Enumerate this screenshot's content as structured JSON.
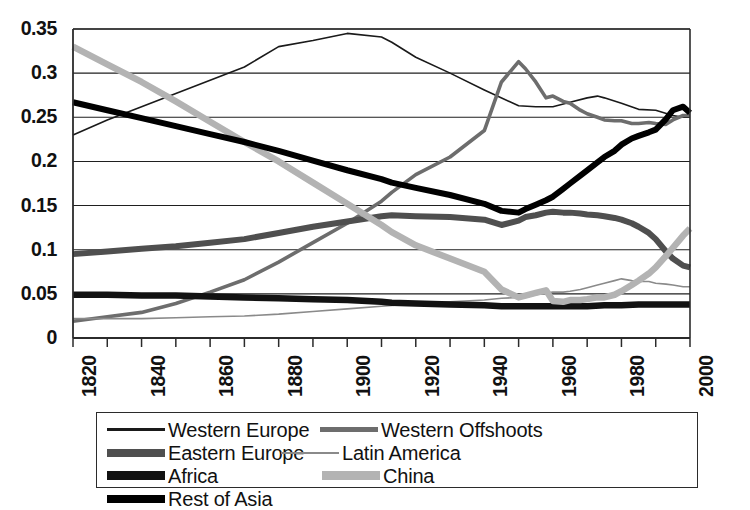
{
  "chart_data": {
    "type": "line",
    "title": "",
    "xlabel": "",
    "ylabel": "",
    "xlim": [
      1820,
      2000
    ],
    "ylim": [
      0,
      0.35
    ],
    "grid": true,
    "grid_axis": "y",
    "legend_position": "bottom",
    "x_tick_labels": [
      "1820",
      "1840",
      "1860",
      "1880",
      "1900",
      "1920",
      "1940",
      "1960",
      "1980",
      "2000"
    ],
    "x_tick_values": [
      1820,
      1840,
      1860,
      1880,
      1900,
      1920,
      1940,
      1960,
      1980,
      2000
    ],
    "x_minor_tick_interval": 10,
    "y_tick_labels": [
      "0",
      "0.05",
      "0.1",
      "0.15",
      "0.2",
      "0.25",
      "0.3",
      "0.35"
    ],
    "y_tick_values": [
      0,
      0.05,
      0.1,
      0.15,
      0.2,
      0.25,
      0.3,
      0.35
    ],
    "series": [
      {
        "name": "Western Europe",
        "color": "#1a1a1a",
        "width": 1.6,
        "x": [
          1820,
          1830,
          1840,
          1850,
          1860,
          1870,
          1880,
          1890,
          1900,
          1910,
          1913,
          1920,
          1930,
          1940,
          1950,
          1955,
          1960,
          1965,
          1970,
          1973,
          1975,
          1980,
          1985,
          1990,
          1995,
          1998,
          2000
        ],
        "values": [
          0.23,
          0.247,
          0.262,
          0.277,
          0.292,
          0.307,
          0.33,
          0.337,
          0.345,
          0.341,
          0.335,
          0.318,
          0.3,
          0.281,
          0.263,
          0.262,
          0.262,
          0.267,
          0.272,
          0.274,
          0.272,
          0.266,
          0.259,
          0.258,
          0.252,
          0.25,
          0.25
        ]
      },
      {
        "name": "Western Offshoots",
        "color": "#6d6d6d",
        "width": 3.6,
        "x": [
          1820,
          1830,
          1840,
          1850,
          1860,
          1870,
          1880,
          1890,
          1900,
          1910,
          1913,
          1920,
          1930,
          1940,
          1945,
          1950,
          1952,
          1955,
          1958,
          1960,
          1963,
          1965,
          1968,
          1970,
          1973,
          1975,
          1978,
          1980,
          1983,
          1985,
          1988,
          1990,
          1993,
          1995,
          1998,
          2000
        ],
        "values": [
          0.019,
          0.024,
          0.029,
          0.039,
          0.052,
          0.066,
          0.086,
          0.108,
          0.13,
          0.155,
          0.165,
          0.185,
          0.205,
          0.235,
          0.29,
          0.313,
          0.305,
          0.29,
          0.272,
          0.274,
          0.268,
          0.266,
          0.258,
          0.254,
          0.25,
          0.247,
          0.246,
          0.246,
          0.243,
          0.243,
          0.244,
          0.243,
          0.242,
          0.247,
          0.252,
          0.252
        ]
      },
      {
        "name": "Eastern Europe",
        "color": "#4f4f4f",
        "width": 6.0,
        "x": [
          1820,
          1830,
          1840,
          1850,
          1860,
          1870,
          1880,
          1890,
          1900,
          1910,
          1913,
          1920,
          1930,
          1940,
          1945,
          1950,
          1952,
          1955,
          1958,
          1960,
          1963,
          1965,
          1968,
          1970,
          1973,
          1975,
          1978,
          1980,
          1983,
          1985,
          1988,
          1990,
          1993,
          1995,
          1998,
          2000
        ],
        "values": [
          0.095,
          0.098,
          0.101,
          0.104,
          0.108,
          0.112,
          0.119,
          0.126,
          0.132,
          0.138,
          0.139,
          0.138,
          0.137,
          0.134,
          0.128,
          0.133,
          0.137,
          0.139,
          0.142,
          0.143,
          0.142,
          0.142,
          0.141,
          0.14,
          0.139,
          0.138,
          0.136,
          0.134,
          0.13,
          0.126,
          0.119,
          0.112,
          0.098,
          0.09,
          0.082,
          0.08
        ]
      },
      {
        "name": "Latin America",
        "color": "#8a8a8a",
        "width": 1.6,
        "x": [
          1820,
          1830,
          1840,
          1850,
          1860,
          1870,
          1880,
          1890,
          1900,
          1910,
          1913,
          1920,
          1930,
          1940,
          1945,
          1950,
          1952,
          1955,
          1958,
          1960,
          1963,
          1965,
          1968,
          1970,
          1973,
          1975,
          1978,
          1980,
          1983,
          1985,
          1988,
          1990,
          1993,
          1995,
          1998,
          2000
        ],
        "values": [
          0.022,
          0.022,
          0.022,
          0.023,
          0.024,
          0.025,
          0.027,
          0.03,
          0.033,
          0.036,
          0.037,
          0.039,
          0.041,
          0.043,
          0.045,
          0.046,
          0.046,
          0.049,
          0.051,
          0.052,
          0.052,
          0.053,
          0.055,
          0.057,
          0.06,
          0.062,
          0.065,
          0.067,
          0.065,
          0.064,
          0.064,
          0.062,
          0.061,
          0.06,
          0.058,
          0.058
        ]
      },
      {
        "name": "Africa",
        "color": "#121212",
        "width": 6.5,
        "x": [
          1820,
          1830,
          1840,
          1850,
          1860,
          1870,
          1880,
          1890,
          1900,
          1910,
          1913,
          1920,
          1930,
          1940,
          1945,
          1950,
          1955,
          1960,
          1965,
          1970,
          1975,
          1980,
          1985,
          1990,
          1995,
          1998,
          2000
        ],
        "values": [
          0.049,
          0.049,
          0.048,
          0.048,
          0.047,
          0.046,
          0.045,
          0.044,
          0.043,
          0.041,
          0.04,
          0.039,
          0.038,
          0.037,
          0.036,
          0.036,
          0.036,
          0.036,
          0.036,
          0.036,
          0.037,
          0.037,
          0.038,
          0.038,
          0.038,
          0.038,
          0.038
        ]
      },
      {
        "name": "China",
        "color": "#b3b3b3",
        "width": 6.5,
        "x": [
          1820,
          1830,
          1840,
          1850,
          1860,
          1870,
          1880,
          1890,
          1900,
          1910,
          1913,
          1920,
          1930,
          1940,
          1945,
          1950,
          1952,
          1955,
          1958,
          1960,
          1963,
          1965,
          1968,
          1970,
          1973,
          1975,
          1978,
          1980,
          1983,
          1985,
          1988,
          1990,
          1993,
          1995,
          1998,
          2000
        ],
        "values": [
          0.33,
          0.31,
          0.29,
          0.268,
          0.245,
          0.222,
          0.2,
          0.176,
          0.152,
          0.128,
          0.12,
          0.105,
          0.09,
          0.075,
          0.055,
          0.046,
          0.048,
          0.051,
          0.054,
          0.042,
          0.041,
          0.043,
          0.043,
          0.044,
          0.046,
          0.046,
          0.049,
          0.053,
          0.06,
          0.065,
          0.073,
          0.08,
          0.093,
          0.102,
          0.116,
          0.124
        ]
      },
      {
        "name": "Rest of Asia",
        "color": "#000000",
        "width": 6.0,
        "x": [
          1820,
          1830,
          1840,
          1850,
          1860,
          1870,
          1880,
          1890,
          1900,
          1910,
          1913,
          1920,
          1930,
          1940,
          1945,
          1950,
          1952,
          1955,
          1958,
          1960,
          1963,
          1965,
          1968,
          1970,
          1973,
          1975,
          1978,
          1980,
          1983,
          1985,
          1988,
          1990,
          1993,
          1995,
          1998,
          2000
        ],
        "values": [
          0.267,
          0.258,
          0.249,
          0.24,
          0.231,
          0.222,
          0.212,
          0.201,
          0.19,
          0.18,
          0.176,
          0.17,
          0.162,
          0.152,
          0.144,
          0.142,
          0.146,
          0.151,
          0.156,
          0.16,
          0.169,
          0.175,
          0.184,
          0.19,
          0.199,
          0.205,
          0.212,
          0.219,
          0.226,
          0.229,
          0.233,
          0.236,
          0.248,
          0.258,
          0.262,
          0.255
        ]
      }
    ]
  },
  "legend": {
    "items": [
      {
        "label": "Western Europe",
        "color": "#1a1a1a",
        "thickness": 3
      },
      {
        "label": "Western Offshoots",
        "color": "#6d6d6d",
        "thickness": 5
      },
      {
        "label": "Eastern Europe",
        "color": "#4f4f4f",
        "thickness": 8
      },
      {
        "label": "Latin America",
        "color": "#8a8a8a",
        "thickness": 2
      },
      {
        "label": "Africa",
        "color": "#121212",
        "thickness": 9
      },
      {
        "label": "China",
        "color": "#b3b3b3",
        "thickness": 9
      },
      {
        "label": "Rest of Asia",
        "color": "#000000",
        "thickness": 8
      }
    ]
  },
  "axes": {
    "line_color": "#2b2b2b",
    "grid_color": "#1f1f1f"
  }
}
